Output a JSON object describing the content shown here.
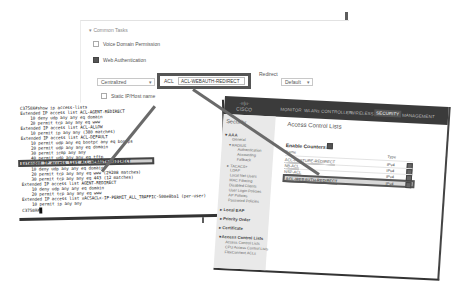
{
  "common_tasks": {
    "title": "▾ Common Tasks",
    "voice_domain_permission": {
      "label": "Voice Domain Permission",
      "checked": false
    },
    "web_authentication": {
      "label": "Web Authentication",
      "checked": true
    },
    "auth_mode": {
      "value": "Centralized",
      "caret": "▾"
    },
    "acl": {
      "label": "ACL",
      "value": "ACL-WEBAUTH-REDIRECT"
    },
    "redirect": {
      "label": "Redirect",
      "value": "Default",
      "caret": "▾"
    },
    "static_ip_host_name": {
      "label": "Static IP/Host name",
      "checked": false
    },
    "auto_smart_port": {
      "label": "Auto Smart Port",
      "checked": false
    }
  },
  "terminal": {
    "lines": [
      "C3750X#show ip access-lists",
      "Extended IP access list ACL-AGENT-REDIRECT",
      "    10 deny udp any any eq domain",
      "    20 permit tcp any any eq www",
      "Extended IP access list ACL-ALLOW",
      "    10 permit ip any any (380 matches)",
      "Extended IP access list ACL-DEFAULT",
      "    10 permit udp any eq bootpc any eq bootps",
      "    20 permit udp any any eq domain",
      "    30 permit icmp any any",
      "    40 permit udp any any eq tftp",
      "    50 deny ip any any",
      "Extended IP access list ACL-WEBAUTH-REDIRECT",
      "    10 deny udp any any eq domain",
      "    20 permit tcp any any eq www (29208 matches)",
      "    30 permit tcp any any eq 443 (12 matches)",
      "Extended IP access list AGENT-REDIRECT",
      "    10 deny udp any any eq domain",
      "    20 permit tcp any any eq www",
      "Extended IP access list xACSACLx-IP-PERMIT_ALL_TRAFFIC-500e8ba1 (per-user)",
      "    10 permit ip any any",
      "C3750X#"
    ],
    "highlighted_line_index": 12
  },
  "wlc": {
    "logo_mark": "·ıı|ıı·",
    "logo_text": "CISCO",
    "nav": [
      "MONITOR",
      "WLANs",
      "CONTROLLER",
      "WIRELESS",
      "SECURITY",
      "MANAGEMENT"
    ],
    "active_nav": "SECURITY",
    "sidebar": {
      "title": "Security",
      "items": [
        {
          "label": "▾ AAA",
          "type": "head"
        },
        {
          "label": "General",
          "type": "sub"
        },
        {
          "label": "▾ RADIUS",
          "type": "sub"
        },
        {
          "label": "Authentication",
          "type": "subsub"
        },
        {
          "label": "Accounting",
          "type": "subsub"
        },
        {
          "label": "Fallback",
          "type": "subsub"
        },
        {
          "label": "▸ TACACS+",
          "type": "sub"
        },
        {
          "label": "LDAP",
          "type": "sub"
        },
        {
          "label": "Local Net Users",
          "type": "sub"
        },
        {
          "label": "MAC Filtering",
          "type": "sub"
        },
        {
          "label": "Disabled Clients",
          "type": "sub"
        },
        {
          "label": "User Login Policies",
          "type": "sub"
        },
        {
          "label": "AP Policies",
          "type": "sub"
        },
        {
          "label": "Password Policies",
          "type": "sub"
        },
        {
          "label": "▸ Local EAP",
          "type": "head"
        },
        {
          "label": "▸ Priority Order",
          "type": "head"
        },
        {
          "label": "▸ Certificate",
          "type": "head"
        },
        {
          "label": "▾ Access Control Lists",
          "type": "head"
        },
        {
          "label": "Access Control Lists",
          "type": "sub"
        },
        {
          "label": "CPU Access Control Lists",
          "type": "sub"
        },
        {
          "label": "FlexConnect ACLs",
          "type": "sub"
        }
      ]
    },
    "page_title": "Access Control Lists",
    "enable_counters": "Enable Counters",
    "columns": {
      "name": "Name",
      "type": "Type"
    },
    "rows": [
      {
        "name": "ACL-POSTURE-REDIRECT",
        "type": "IPv4"
      },
      {
        "name": "NB-ACL",
        "type": "IPv4"
      },
      {
        "name": "NSP-ACL",
        "type": "IPv4"
      },
      {
        "name": "ACL-WEBAUTH-REDIRECT",
        "type": "IPv4"
      }
    ],
    "highlighted_row_index": 3
  }
}
